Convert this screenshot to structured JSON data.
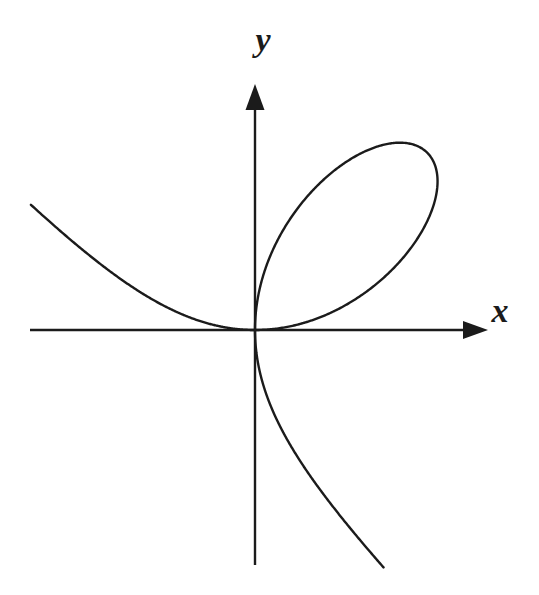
{
  "figure": {
    "background": "#ffffff",
    "ink": "#1b1b1b"
  },
  "chart_data": {
    "type": "line",
    "title": "",
    "xlabel": "x",
    "ylabel": "y",
    "grid": false,
    "axis_style": "centered-arrow-axes",
    "xlim": [
      -1.95,
      2.03
    ],
    "ylim": [
      -1.99,
      2.08
    ],
    "curve": {
      "name": "folium-of-descartes",
      "equation": "x^3 + y^3 = 3xy",
      "parametric_x": "3t/(1+t^3)",
      "parametric_y": "3t^2/(1+t^3)",
      "key_points": {
        "node_origin": [
          0,
          0
        ],
        "loop_vertex": [
          1.5,
          1.5
        ],
        "loop_top": [
          1.26,
          1.587
        ],
        "loop_right": [
          1.587,
          1.26
        ]
      },
      "branches": [
        {
          "name": "second-quadrant-branch",
          "theta_from": -0.4987,
          "theta_to": -1e-05,
          "samples": 220
        },
        {
          "name": "first-quadrant-loop",
          "theta_from": 0.0,
          "theta_to": 1.57069,
          "samples": 420
        },
        {
          "name": "fourth-quadrant-branch",
          "theta_from": -1.57069,
          "theta_to": -1.0637,
          "samples": 320
        }
      ],
      "note": "t = tan(theta); node at origin tangent to both axes"
    },
    "plot": {
      "origin_px": [
        255,
        330
      ],
      "px_per_unit": [
        115,
        118
      ],
      "x_axis": {
        "x_start": 30,
        "x_end": 464,
        "y": 330,
        "arrow_tip_x": 488,
        "arrow_len": 25,
        "arrow_half_w": 9
      },
      "y_axis": {
        "y_start": 565,
        "y_end": 109,
        "x": 255,
        "arrow_tip_y": 84,
        "arrow_len": 26,
        "arrow_half_w": 9.5
      },
      "label_pos": {
        "x": [
          500,
          322
        ],
        "y": [
          263,
          51
        ]
      },
      "stroke_width": 2.4
    }
  }
}
